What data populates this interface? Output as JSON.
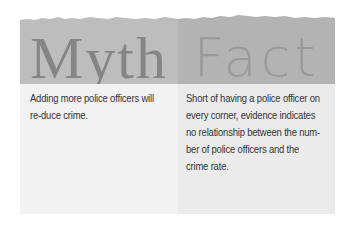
{
  "myth": {
    "heading": "Myth",
    "text": "Adding more police officers will re-duce crime."
  },
  "fact": {
    "heading": "Fact",
    "text": "Short of having a police officer on every corner, evidence indicates no relationship between the num-ber of police officers and the crime rate."
  },
  "colors": {
    "myth_header_bg": "#bdbdbd",
    "fact_header_bg": "#b3b3b3",
    "myth_body_bg": "#f2f2f2",
    "fact_body_bg": "#ebebeb",
    "myth_heading_color": "#858585",
    "fact_heading_color": "#9a9a9a",
    "body_text_color": "#333333"
  }
}
